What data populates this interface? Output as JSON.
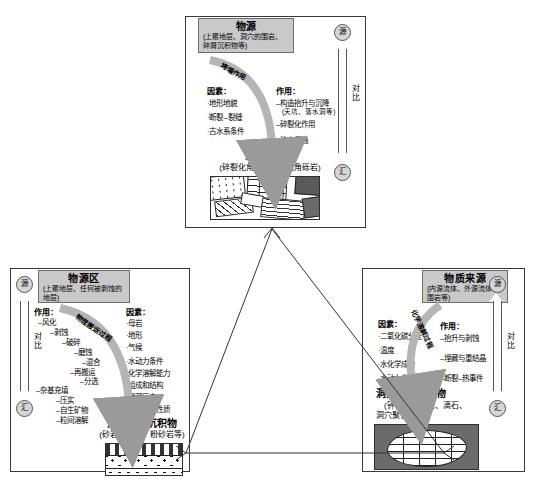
{
  "diagram": {
    "legend_axis": {
      "source": "源",
      "sink": "汇",
      "compare": "对比"
    }
  },
  "top_panel": {
    "name": "洞穴角砾岩成因",
    "title": {
      "main": "物源",
      "sub": "(上覆地层、洞穴的围岩、碎屑沉积物等)"
    },
    "arc_label": "垮塌作用",
    "factors_header": "因素：",
    "factors": [
      "·地形地貌",
      "·断裂–裂缝",
      "·古水系条件"
    ],
    "effects_header": "作用：",
    "effects": [
      "–构造抬升与沉降",
      "–碎裂化作用",
      "–流水侵蚀"
    ],
    "effect_sub": "(天坑、落水洞等)",
    "product": {
      "title": "洞穴角砾岩",
      "sub": "(碎裂化角砾岩、杂乱角砾岩)"
    }
  },
  "left_panel": {
    "name": "洞穴机械沉积物成因",
    "title": {
      "main": "物源区",
      "sub": "(上覆地层、任何被剥蚀的地层)"
    },
    "arc_label": "物理搬运过程",
    "effects_header": "作用：",
    "effects": [
      "–风化",
      "–剥蚀",
      "–破碎",
      "–磨蚀",
      "–混合",
      "–再搬运",
      "–分选"
    ],
    "effects_second": [
      "–杂基充填",
      "–压实",
      "–自生矿物",
      "–粒间溶解"
    ],
    "factors_header": "因素：",
    "factors": [
      "·母岩",
      "·地形",
      "·气候",
      "·水动力条件",
      "·化学溶解能力",
      "·组成和结构",
      "·埋藏历史",
      "·流体化学性质"
    ],
    "product": {
      "title": "洞穴机械沉积物",
      "sub": "(砂岩、泥岩、粉砂岩等)"
    }
  },
  "right_panel": {
    "name": "洞穴化学充填物成因",
    "title": {
      "main": "物质来源",
      "sub": "(内源流体、外源流体、围岩等)"
    },
    "arc_label": "化学溶解过程",
    "factors_header": "因素：",
    "factors": [
      "·二氧化碳分压",
      "·温度",
      "·水化学成分",
      "·水动力参数"
    ],
    "effects_header": "作用：",
    "effects": [
      "–抬升与剥蚀",
      "–埋藏与重结晶",
      "–断裂–热事件"
    ],
    "product": {
      "title": "洞穴化学充填物",
      "sub1": "(钟乳石、流石、滴石、",
      "sub2": "洞穴聚合物等)"
    }
  },
  "colors": {
    "title_fill": "#c9c9c9",
    "panel_border": "#3a3a3a",
    "arc_fill": "#b5b5b5",
    "host_rock": "#6b6b6b",
    "dark_clast": "#5a5a5a"
  }
}
